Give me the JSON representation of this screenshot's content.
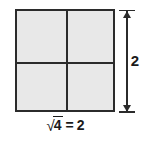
{
  "figure": {
    "kind": "square-root-area-model",
    "square": {
      "label": "square-divided-into-4-unit-cells",
      "rows": 2,
      "columns": 2,
      "total_cells": 4,
      "fill_color": "#e8e8e8",
      "stroke_color": "#2b2b2b"
    },
    "dimension": {
      "orientation": "vertical",
      "value": "2",
      "arrow_style": "double-headed",
      "color": "#2b2b2b"
    },
    "caption": {
      "radical_symbol": "√",
      "radicand": "4",
      "equals": "=",
      "result": "2",
      "full_text": "√4 = 2"
    }
  }
}
